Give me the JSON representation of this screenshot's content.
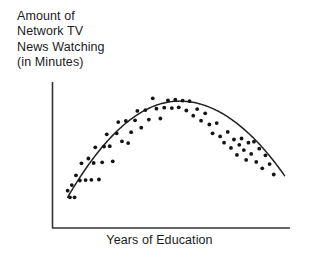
{
  "chart_data": {
    "type": "scatter",
    "title": "",
    "ylabel": "Amount of\nNetwork TV\nNews Watching\n(in Minutes)",
    "xlabel": "Years of Education",
    "ylabel_lines": [
      "Amount of",
      "Network TV",
      "News Watching",
      "(in Minutes)"
    ],
    "grid": false,
    "legend": null,
    "axis_ticks": false,
    "axis_tick_labels": [],
    "xlim": [
      0,
      10
    ],
    "ylim": [
      0,
      10
    ],
    "relationship": "curvilinear-inverted-u",
    "point_color": "#141414",
    "line_color": "#222222",
    "axis_color": "#333333",
    "points": [
      [
        0.42,
        1.52
      ],
      [
        0.52,
        1.05
      ],
      [
        0.6,
        1.92
      ],
      [
        0.72,
        1.05
      ],
      [
        0.78,
        2.62
      ],
      [
        0.95,
        2.25
      ],
      [
        1.02,
        3.48
      ],
      [
        1.2,
        2.28
      ],
      [
        1.32,
        3.82
      ],
      [
        1.45,
        2.3
      ],
      [
        1.55,
        3.5
      ],
      [
        1.62,
        4.62
      ],
      [
        1.78,
        2.32
      ],
      [
        1.92,
        3.55
      ],
      [
        2.0,
        4.68
      ],
      [
        2.12,
        5.55
      ],
      [
        2.25,
        4.7
      ],
      [
        2.38,
        3.62
      ],
      [
        2.55,
        5.62
      ],
      [
        2.62,
        6.42
      ],
      [
        2.78,
        5.05
      ],
      [
        2.95,
        6.5
      ],
      [
        3.05,
        4.92
      ],
      [
        3.18,
        5.7
      ],
      [
        3.35,
        6.55
      ],
      [
        3.45,
        7.22
      ],
      [
        3.62,
        6.02
      ],
      [
        3.8,
        7.28
      ],
      [
        3.95,
        6.6
      ],
      [
        4.12,
        8.12
      ],
      [
        4.28,
        7.38
      ],
      [
        4.45,
        6.68
      ],
      [
        4.62,
        7.45
      ],
      [
        4.78,
        7.98
      ],
      [
        4.95,
        7.42
      ],
      [
        5.1,
        8.02
      ],
      [
        5.25,
        7.48
      ],
      [
        5.42,
        7.95
      ],
      [
        5.58,
        7.25
      ],
      [
        5.72,
        7.92
      ],
      [
        5.88,
        6.88
      ],
      [
        6.05,
        7.35
      ],
      [
        6.22,
        6.52
      ],
      [
        6.4,
        7.05
      ],
      [
        6.58,
        6.25
      ],
      [
        6.72,
        5.62
      ],
      [
        6.9,
        6.35
      ],
      [
        7.05,
        5.4
      ],
      [
        7.22,
        4.95
      ],
      [
        7.38,
        5.72
      ],
      [
        7.52,
        4.58
      ],
      [
        7.65,
        5.18
      ],
      [
        7.78,
        4.08
      ],
      [
        7.88,
        4.8
      ],
      [
        7.98,
        5.25
      ],
      [
        8.08,
        4.42
      ],
      [
        8.18,
        3.72
      ],
      [
        8.28,
        4.95
      ],
      [
        8.4,
        4.15
      ],
      [
        8.52,
        5.02
      ],
      [
        8.62,
        3.58
      ],
      [
        8.75,
        4.52
      ],
      [
        8.88,
        3.12
      ],
      [
        9.02,
        4.05
      ],
      [
        9.2,
        3.42
      ],
      [
        9.38,
        2.68
      ]
    ],
    "fit_curve": {
      "description": "smoothed inverted-U trend line",
      "peak_x": 5.28,
      "peak_y": 7.92,
      "start": [
        0.42,
        1.05
      ],
      "end": [
        9.85,
        2.6
      ]
    }
  }
}
